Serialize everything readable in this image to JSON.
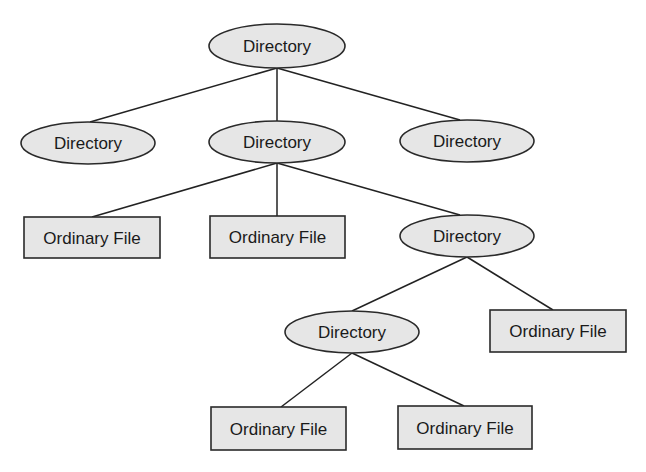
{
  "diagram": {
    "type": "tree",
    "title": "",
    "nodes": [
      {
        "id": "root",
        "kind": "directory",
        "label": "Directory",
        "shape": "ellipse",
        "cx": 277,
        "cy": 46,
        "rx": 68,
        "ry": 22
      },
      {
        "id": "d_left",
        "kind": "directory",
        "label": "Directory",
        "shape": "ellipse",
        "cx": 88,
        "cy": 143,
        "rx": 67,
        "ry": 21
      },
      {
        "id": "d_mid",
        "kind": "directory",
        "label": "Directory",
        "shape": "ellipse",
        "cx": 277,
        "cy": 142,
        "rx": 68,
        "ry": 21
      },
      {
        "id": "d_right",
        "kind": "directory",
        "label": "Directory",
        "shape": "ellipse",
        "cx": 467,
        "cy": 141,
        "rx": 67,
        "ry": 21
      },
      {
        "id": "f1",
        "kind": "file",
        "label": "Ordinary File",
        "shape": "rect",
        "x": 24,
        "y": 217,
        "w": 136,
        "h": 41
      },
      {
        "id": "f2",
        "kind": "file",
        "label": "Ordinary File",
        "shape": "rect",
        "x": 210,
        "y": 216,
        "w": 135,
        "h": 42
      },
      {
        "id": "d_sub",
        "kind": "directory",
        "label": "Directory",
        "shape": "ellipse",
        "cx": 467,
        "cy": 236,
        "rx": 67,
        "ry": 21
      },
      {
        "id": "d_subsub",
        "kind": "directory",
        "label": "Directory",
        "shape": "ellipse",
        "cx": 352,
        "cy": 332,
        "rx": 67,
        "ry": 21
      },
      {
        "id": "f3",
        "kind": "file",
        "label": "Ordinary File",
        "shape": "rect",
        "x": 490,
        "y": 310,
        "w": 136,
        "h": 42
      },
      {
        "id": "f4",
        "kind": "file",
        "label": "Ordinary File",
        "shape": "rect",
        "x": 211,
        "y": 407,
        "w": 135,
        "h": 43
      },
      {
        "id": "f5",
        "kind": "file",
        "label": "Ordinary File",
        "shape": "rect",
        "x": 398,
        "y": 406,
        "w": 134,
        "h": 43
      }
    ],
    "edges": [
      {
        "from": "root",
        "to": "d_left",
        "x1": 277,
        "y1": 68,
        "x2": 90,
        "y2": 122
      },
      {
        "from": "root",
        "to": "d_mid",
        "x1": 277,
        "y1": 68,
        "x2": 277,
        "y2": 121
      },
      {
        "from": "root",
        "to": "d_right",
        "x1": 277,
        "y1": 68,
        "x2": 460,
        "y2": 120
      },
      {
        "from": "d_mid",
        "to": "f1",
        "x1": 277,
        "y1": 163,
        "x2": 92,
        "y2": 217
      },
      {
        "from": "d_mid",
        "to": "f2",
        "x1": 277,
        "y1": 163,
        "x2": 277,
        "y2": 216
      },
      {
        "from": "d_mid",
        "to": "d_sub",
        "x1": 277,
        "y1": 163,
        "x2": 460,
        "y2": 215
      },
      {
        "from": "d_sub",
        "to": "d_subsub",
        "x1": 467,
        "y1": 257,
        "x2": 352,
        "y2": 311
      },
      {
        "from": "d_sub",
        "to": "f3",
        "x1": 467,
        "y1": 257,
        "x2": 553,
        "y2": 310
      },
      {
        "from": "d_subsub",
        "to": "f4",
        "x1": 352,
        "y1": 353,
        "x2": 281,
        "y2": 407
      },
      {
        "from": "d_subsub",
        "to": "f5",
        "x1": 352,
        "y1": 353,
        "x2": 464,
        "y2": 406
      }
    ],
    "colors": {
      "node_fill": "#e6e6e6",
      "stroke": "#2a2a2a",
      "text": "#1a1a1a",
      "background": "#ffffff"
    }
  }
}
